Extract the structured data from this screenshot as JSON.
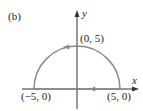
{
  "figure": {
    "panel_label": "(b)",
    "axes": {
      "x_label": "x",
      "y_label": "y"
    },
    "points": {
      "top": "(0, 5)",
      "left": "(−5, 0)",
      "right": "(5, 0)"
    },
    "curve": {
      "type": "semicircle",
      "center": [
        0,
        0
      ],
      "radius": 5,
      "orientation": "counterclockwise along arc, then along x-axis from (-5,0) to (5,0)"
    },
    "colors": {
      "curve": "#8a8a8a",
      "axes": "#333333",
      "text": "#222222"
    }
  }
}
